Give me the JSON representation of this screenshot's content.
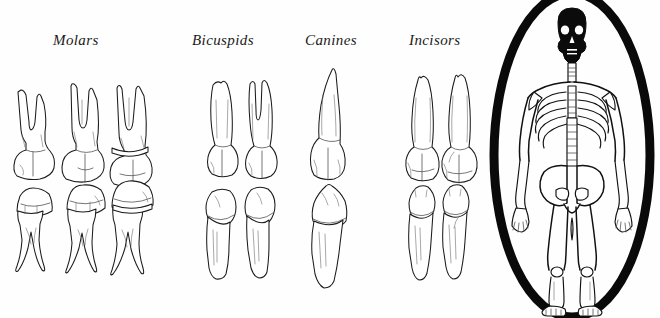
{
  "figure": {
    "style": "black-and-white line illustration",
    "background_color": "#ffffff",
    "ink_color": "#1b1b1b"
  },
  "labels": [
    {
      "id": "molars",
      "text": "Molars",
      "x": 53,
      "y": 32
    },
    {
      "id": "bicuspids",
      "text": "Bicuspids",
      "x": 192,
      "y": 32
    },
    {
      "id": "canines",
      "text": "Canines",
      "x": 305,
      "y": 32
    },
    {
      "id": "incisors",
      "text": "Incisors",
      "x": 409,
      "y": 32
    }
  ],
  "tooth_groups": [
    {
      "name": "molars",
      "label": "Molars",
      "upper_count": 3,
      "lower_count": 3,
      "upper_description": "maxillary molars with two to three splayed roots above a broad bulbous crown",
      "lower_description": "mandibular molars with a wide crown on top and two long descending roots"
    },
    {
      "name": "bicuspids",
      "label": "Bicuspids",
      "upper_count": 2,
      "lower_count": 2,
      "upper_description": "maxillary premolars, one single-rooted and one bifurcated, crown below",
      "lower_description": "mandibular premolars with rounded crown on top and single tapering root"
    },
    {
      "name": "canines",
      "label": "Canines",
      "upper_count": 1,
      "lower_count": 1,
      "upper_description": "maxillary canine with a long curved single root and pointed crown below",
      "lower_description": "mandibular canine with pointed crown on top and long slender root"
    },
    {
      "name": "incisors",
      "label": "Incisors",
      "upper_count": 2,
      "lower_count": 2,
      "upper_description": "maxillary incisors with single straight roots and wide flat chisel crowns",
      "lower_description": "mandibular incisors with small narrow crowns and slim roots"
    }
  ],
  "inset": {
    "name": "skeleton-inset",
    "subject": "full anterior human skeleton",
    "frame_shape": "oval",
    "frame_note": "thick brush stroke on the left side tapering thin on the right",
    "frame_color": "#0a0a0a",
    "skull_fill": "#0b0b0b",
    "parts": [
      "skull",
      "mandible",
      "cervical spine",
      "clavicles",
      "scapulae",
      "ribcage",
      "sternum",
      "thoracic spine",
      "lumbar spine",
      "pelvis",
      "humerus",
      "radius",
      "ulna",
      "hands",
      "femur",
      "patella",
      "tibia",
      "fibula",
      "feet"
    ]
  }
}
